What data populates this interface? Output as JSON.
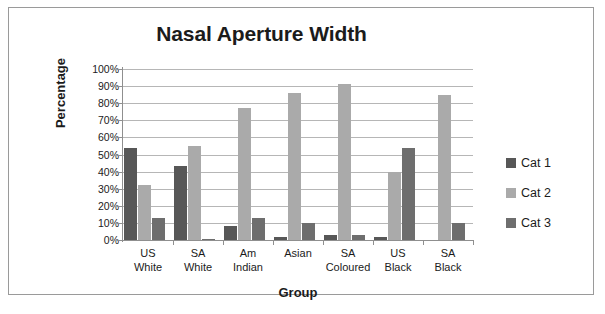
{
  "chart_data": {
    "type": "bar",
    "title": "Nasal Aperture Width",
    "xlabel": "Group",
    "ylabel": "Percentage",
    "ylim": [
      0,
      100
    ],
    "ytick_labels": [
      "100%",
      "90%",
      "80%",
      "70%",
      "60%",
      "50%",
      "40%",
      "30%",
      "20%",
      "10%",
      "0%"
    ],
    "ytick_values": [
      100,
      90,
      80,
      70,
      60,
      50,
      40,
      30,
      20,
      10,
      0
    ],
    "grid": true,
    "legend_position": "right",
    "categories": [
      "US White",
      "SA White",
      "Am Indian",
      "Asian",
      "SA Coloured",
      "US Black",
      "SA Black"
    ],
    "category_lines": [
      [
        "US",
        "White"
      ],
      [
        "SA",
        "White"
      ],
      [
        "Am",
        "Indian"
      ],
      [
        "Asian",
        ""
      ],
      [
        "SA",
        "Coloured"
      ],
      [
        "US",
        "Black"
      ],
      [
        "SA",
        "Black"
      ]
    ],
    "series": [
      {
        "name": "Cat 1",
        "color": "#575757",
        "values": [
          54,
          43,
          8,
          2,
          3,
          2,
          0
        ]
      },
      {
        "name": "Cat 2",
        "color": "#aaaaaa",
        "values": [
          32,
          55,
          77,
          86,
          91,
          40,
          85
        ]
      },
      {
        "name": "Cat 3",
        "color": "#6e6e6e",
        "values": [
          13,
          0.5,
          13,
          10,
          3,
          54,
          10
        ]
      }
    ]
  },
  "legend": {
    "items": [
      {
        "label": "Cat 1",
        "color": "#575757"
      },
      {
        "label": "Cat 2",
        "color": "#aaaaaa"
      },
      {
        "label": "Cat 3",
        "color": "#6e6e6e"
      }
    ]
  }
}
